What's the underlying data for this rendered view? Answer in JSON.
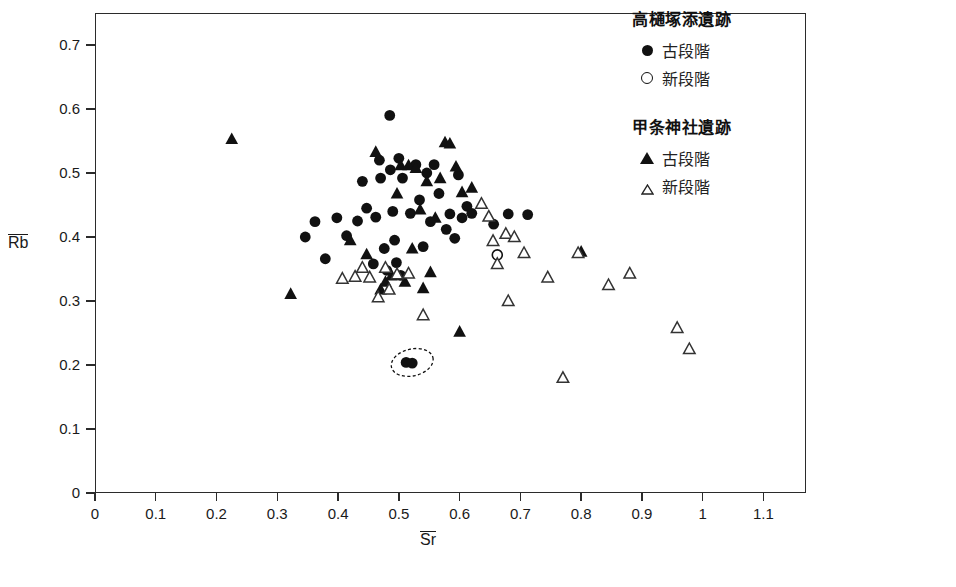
{
  "chart_data": {
    "type": "scatter",
    "title": "",
    "xlabel": "Sr",
    "ylabel": "Rb",
    "xlabel_overbar": true,
    "ylabel_overbar": true,
    "xlim": [
      0,
      1.17
    ],
    "ylim": [
      0,
      0.75
    ],
    "grid": false,
    "x_ticks": [
      "0",
      "0.1",
      "0.2",
      "0.3",
      "0.4",
      "0.5",
      "0.6",
      "0.7",
      "0.8",
      "0.9",
      "1",
      "1.1"
    ],
    "x_tick_values": [
      0,
      0.1,
      0.2,
      0.3,
      0.4,
      0.5,
      0.6,
      0.7,
      0.8,
      0.9,
      1.0,
      1.1
    ],
    "y_ticks": [
      "0",
      "0.1",
      "0.2",
      "0.3",
      "0.4",
      "0.5",
      "0.6",
      "0.7"
    ],
    "y_tick_values": [
      0,
      0.1,
      0.2,
      0.3,
      0.4,
      0.5,
      0.6,
      0.7
    ],
    "legend_position": "right",
    "annotations": [
      {
        "type": "dashed-ellipse",
        "cx": 0.522,
        "cy": 0.204,
        "rx": 0.035,
        "ry": 0.021
      }
    ],
    "series": [
      {
        "name": "高樋塚添遺跡 古段階",
        "marker": "filled-circle",
        "color": "#111111",
        "points": [
          [
            0.346,
            0.4
          ],
          [
            0.362,
            0.424
          ],
          [
            0.379,
            0.366
          ],
          [
            0.398,
            0.43
          ],
          [
            0.414,
            0.402
          ],
          [
            0.432,
            0.425
          ],
          [
            0.44,
            0.487
          ],
          [
            0.447,
            0.445
          ],
          [
            0.458,
            0.358
          ],
          [
            0.462,
            0.431
          ],
          [
            0.468,
            0.52
          ],
          [
            0.47,
            0.492
          ],
          [
            0.476,
            0.382
          ],
          [
            0.48,
            0.348
          ],
          [
            0.485,
            0.59
          ],
          [
            0.486,
            0.505
          ],
          [
            0.49,
            0.44
          ],
          [
            0.493,
            0.395
          ],
          [
            0.496,
            0.36
          ],
          [
            0.5,
            0.523
          ],
          [
            0.503,
            0.34
          ],
          [
            0.506,
            0.492
          ],
          [
            0.512,
            0.204
          ],
          [
            0.519,
            0.437
          ],
          [
            0.522,
            0.203
          ],
          [
            0.528,
            0.513
          ],
          [
            0.534,
            0.458
          ],
          [
            0.54,
            0.385
          ],
          [
            0.546,
            0.5
          ],
          [
            0.552,
            0.424
          ],
          [
            0.558,
            0.513
          ],
          [
            0.566,
            0.468
          ],
          [
            0.578,
            0.412
          ],
          [
            0.584,
            0.436
          ],
          [
            0.592,
            0.398
          ],
          [
            0.598,
            0.497
          ],
          [
            0.604,
            0.43
          ],
          [
            0.612,
            0.448
          ],
          [
            0.62,
            0.437
          ],
          [
            0.656,
            0.42
          ],
          [
            0.68,
            0.436
          ],
          [
            0.712,
            0.435
          ]
        ]
      },
      {
        "name": "高樋塚添遺跡 新段階",
        "marker": "open-circle",
        "color": "#111111",
        "points": [
          [
            0.662,
            0.372
          ]
        ]
      },
      {
        "name": "甲条神社遺跡 古段階",
        "marker": "filled-triangle",
        "color": "#111111",
        "points": [
          [
            0.225,
            0.553
          ],
          [
            0.322,
            0.311
          ],
          [
            0.42,
            0.395
          ],
          [
            0.447,
            0.373
          ],
          [
            0.462,
            0.533
          ],
          [
            0.47,
            0.318
          ],
          [
            0.478,
            0.33
          ],
          [
            0.488,
            0.34
          ],
          [
            0.497,
            0.468
          ],
          [
            0.503,
            0.512
          ],
          [
            0.51,
            0.33
          ],
          [
            0.516,
            0.512
          ],
          [
            0.522,
            0.382
          ],
          [
            0.528,
            0.508
          ],
          [
            0.535,
            0.443
          ],
          [
            0.54,
            0.32
          ],
          [
            0.546,
            0.487
          ],
          [
            0.552,
            0.345
          ],
          [
            0.56,
            0.43
          ],
          [
            0.568,
            0.492
          ],
          [
            0.576,
            0.548
          ],
          [
            0.584,
            0.546
          ],
          [
            0.594,
            0.51
          ],
          [
            0.6,
            0.252
          ],
          [
            0.604,
            0.47
          ],
          [
            0.62,
            0.477
          ],
          [
            0.8,
            0.377
          ]
        ]
      },
      {
        "name": "甲条神社遺跡 新段階",
        "marker": "open-triangle",
        "color": "#333333",
        "points": [
          [
            0.407,
            0.335
          ],
          [
            0.428,
            0.338
          ],
          [
            0.44,
            0.352
          ],
          [
            0.452,
            0.337
          ],
          [
            0.466,
            0.306
          ],
          [
            0.478,
            0.352
          ],
          [
            0.484,
            0.318
          ],
          [
            0.497,
            0.342
          ],
          [
            0.516,
            0.343
          ],
          [
            0.54,
            0.278
          ],
          [
            0.636,
            0.452
          ],
          [
            0.648,
            0.432
          ],
          [
            0.655,
            0.394
          ],
          [
            0.662,
            0.358
          ],
          [
            0.676,
            0.405
          ],
          [
            0.68,
            0.3
          ],
          [
            0.69,
            0.4
          ],
          [
            0.706,
            0.375
          ],
          [
            0.745,
            0.337
          ],
          [
            0.77,
            0.18
          ],
          [
            0.795,
            0.375
          ],
          [
            0.845,
            0.325
          ],
          [
            0.88,
            0.343
          ],
          [
            0.958,
            0.258
          ],
          [
            0.978,
            0.225
          ]
        ]
      }
    ]
  },
  "legend": {
    "groups": [
      {
        "title": "高樋塚添遺跡",
        "entries": [
          {
            "marker": "filled-circle",
            "label": "古段階"
          },
          {
            "marker": "open-circle",
            "label": "新段階"
          }
        ]
      },
      {
        "title": "甲条神社遺跡",
        "entries": [
          {
            "marker": "filled-triangle",
            "label": "古段階"
          },
          {
            "marker": "open-triangle",
            "label": "新段階"
          }
        ]
      }
    ]
  }
}
